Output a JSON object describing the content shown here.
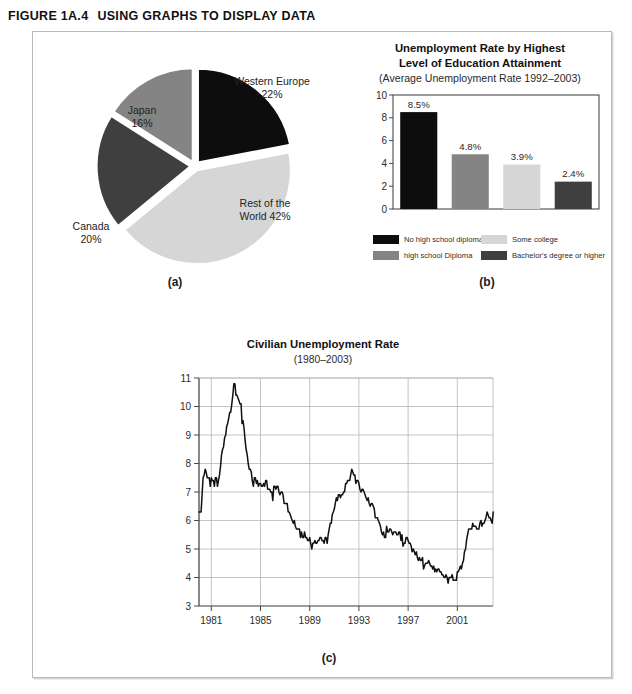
{
  "figure": {
    "number_label": "FIGURE 1A.4",
    "title": "USING GRAPHS TO DISPLAY DATA"
  },
  "panels": {
    "a_caption": "(a)",
    "b_caption": "(b)",
    "c_caption": "(c)"
  },
  "colors": {
    "black": "#0d0d0d",
    "dark_gray": "#3f3f3f",
    "medium_gray": "#848484",
    "light_gray": "#d6d6d6",
    "frame": "#b9b9bb",
    "grid": "#b5b5b5",
    "axis": "#4a4a4a"
  },
  "pie": {
    "labels": {
      "western_europe": "Western Europe\n22%",
      "japan": "Japan\n16%",
      "canada": "Canada\n20%",
      "rest_of_world": "Rest of the\nWorld 42%"
    }
  },
  "bar": {
    "title_line1": "Unemployment Rate by Highest",
    "title_line2": "Level of Education Attainment",
    "subtitle": "(Average Unemployment Rate 1992–2003)",
    "legend": [
      "No high school diploma",
      "Some college",
      "high school Diploma",
      "Bachelor's degree or higher"
    ]
  },
  "line": {
    "title": "Civilian Unemployment  Rate",
    "subtitle": "(1980–2003)"
  },
  "chart_data": [
    {
      "type": "pie",
      "title": "",
      "categories": [
        "Western Europe",
        "Rest of the World",
        "Canada",
        "Japan"
      ],
      "values": [
        22,
        42,
        20,
        16
      ],
      "labels": [
        "Western Europe 22%",
        "Rest of the World 42%",
        "Canada 20%",
        "Japan 16%"
      ],
      "colors": [
        "#0d0d0d",
        "#d6d6d6",
        "#3f3f3f",
        "#848484"
      ],
      "exploded": true,
      "legend": "none"
    },
    {
      "type": "bar",
      "title": "Unemployment Rate by Highest Level of Education Attainment",
      "subtitle": "(Average Unemployment Rate 1992–2003)",
      "categories": [
        "No high school diploma",
        "high school Diploma",
        "Some college",
        "Bachelor's degree or higher"
      ],
      "values": [
        8.5,
        4.8,
        3.9,
        2.4
      ],
      "data_labels": [
        "8.5%",
        "4.8%",
        "3.9%",
        "2.4%"
      ],
      "colors": [
        "#0d0d0d",
        "#848484",
        "#d6d6d6",
        "#3f3f3f"
      ],
      "xlabel": "",
      "ylabel": "",
      "ylim": [
        0,
        10
      ],
      "yticks": [
        0,
        2,
        4,
        6,
        8,
        10
      ],
      "ytick_labels": [
        "0",
        "2",
        "4",
        "6",
        "8",
        "10"
      ],
      "grid": false,
      "legend": "bottom"
    },
    {
      "type": "line",
      "title": "Civilian Unemployment  Rate",
      "subtitle": "(1980–2003)",
      "xlabel": "",
      "ylabel": "",
      "xlim": [
        1980.0,
        2003.9
      ],
      "ylim": [
        3,
        11
      ],
      "yticks": [
        3,
        4,
        5,
        6,
        7,
        8,
        9,
        10,
        11
      ],
      "ytick_labels": [
        "3",
        "4",
        "5",
        "6",
        "7",
        "8",
        "9",
        "10",
        "11"
      ],
      "xticks": [
        1981,
        1985,
        1989,
        1993,
        1997,
        2001
      ],
      "xtick_labels": [
        "1981",
        "1985",
        "1989",
        "1993",
        "1997",
        "2001"
      ],
      "grid": true,
      "legend": "none",
      "series": [
        {
          "name": "Civilian Unemployment Rate",
          "color": "#111111",
          "x": [
            1980.0,
            1980.08,
            1980.17,
            1980.25,
            1980.33,
            1980.42,
            1980.5,
            1980.58,
            1980.67,
            1980.75,
            1980.83,
            1980.92,
            1981.0,
            1981.08,
            1981.17,
            1981.25,
            1981.33,
            1981.42,
            1981.5,
            1981.58,
            1981.67,
            1981.75,
            1981.83,
            1981.92,
            1982.0,
            1982.08,
            1982.17,
            1982.25,
            1982.33,
            1982.42,
            1982.5,
            1982.58,
            1982.67,
            1982.75,
            1982.83,
            1982.92,
            1983.0,
            1983.08,
            1983.17,
            1983.25,
            1983.33,
            1983.42,
            1983.5,
            1983.58,
            1983.67,
            1983.75,
            1983.83,
            1983.92,
            1984.0,
            1984.08,
            1984.17,
            1984.25,
            1984.33,
            1984.42,
            1984.5,
            1984.58,
            1984.67,
            1984.75,
            1984.83,
            1984.92,
            1985.0,
            1985.08,
            1985.17,
            1985.25,
            1985.33,
            1985.42,
            1985.5,
            1985.58,
            1985.67,
            1985.75,
            1985.83,
            1985.92,
            1986.0,
            1986.08,
            1986.17,
            1986.25,
            1986.33,
            1986.42,
            1986.5,
            1986.58,
            1986.67,
            1986.75,
            1986.83,
            1986.92,
            1987.0,
            1987.08,
            1987.17,
            1987.25,
            1987.33,
            1987.42,
            1987.5,
            1987.58,
            1987.67,
            1987.75,
            1987.83,
            1987.92,
            1988.0,
            1988.08,
            1988.17,
            1988.25,
            1988.33,
            1988.42,
            1988.5,
            1988.58,
            1988.67,
            1988.75,
            1988.83,
            1988.92,
            1989.0,
            1989.08,
            1989.17,
            1989.25,
            1989.33,
            1989.42,
            1989.5,
            1989.58,
            1989.67,
            1989.75,
            1989.83,
            1989.92,
            1990.0,
            1990.08,
            1990.17,
            1990.25,
            1990.33,
            1990.42,
            1990.5,
            1990.58,
            1990.67,
            1990.75,
            1990.83,
            1990.92,
            1991.0,
            1991.08,
            1991.17,
            1991.25,
            1991.33,
            1991.42,
            1991.5,
            1991.58,
            1991.67,
            1991.75,
            1991.83,
            1991.92,
            1992.0,
            1992.08,
            1992.17,
            1992.25,
            1992.33,
            1992.42,
            1992.5,
            1992.58,
            1992.67,
            1992.75,
            1992.83,
            1992.92,
            1993.0,
            1993.08,
            1993.17,
            1993.25,
            1993.33,
            1993.42,
            1993.5,
            1993.58,
            1993.67,
            1993.75,
            1993.83,
            1993.92,
            1994.0,
            1994.08,
            1994.17,
            1994.25,
            1994.33,
            1994.42,
            1994.5,
            1994.58,
            1994.67,
            1994.75,
            1994.83,
            1994.92,
            1995.0,
            1995.08,
            1995.17,
            1995.25,
            1995.33,
            1995.42,
            1995.5,
            1995.58,
            1995.67,
            1995.75,
            1995.83,
            1995.92,
            1996.0,
            1996.08,
            1996.17,
            1996.25,
            1996.33,
            1996.42,
            1996.5,
            1996.58,
            1996.67,
            1996.75,
            1996.83,
            1996.92,
            1997.0,
            1997.08,
            1997.17,
            1997.25,
            1997.33,
            1997.42,
            1997.5,
            1997.58,
            1997.67,
            1997.75,
            1997.83,
            1997.92,
            1998.0,
            1998.08,
            1998.17,
            1998.25,
            1998.33,
            1998.42,
            1998.5,
            1998.58,
            1998.67,
            1998.75,
            1998.83,
            1998.92,
            1999.0,
            1999.08,
            1999.17,
            1999.25,
            1999.33,
            1999.42,
            1999.5,
            1999.58,
            1999.67,
            1999.75,
            1999.83,
            1999.92,
            2000.0,
            2000.08,
            2000.17,
            2000.25,
            2000.33,
            2000.42,
            2000.5,
            2000.58,
            2000.67,
            2000.75,
            2000.83,
            2000.92,
            2001.0,
            2001.08,
            2001.17,
            2001.25,
            2001.33,
            2001.42,
            2001.5,
            2001.58,
            2001.67,
            2001.75,
            2001.83,
            2001.92,
            2002.0,
            2002.08,
            2002.17,
            2002.25,
            2002.33,
            2002.42,
            2002.5,
            2002.58,
            2002.67,
            2002.75,
            2002.83,
            2002.92,
            2003.0,
            2003.08,
            2003.17,
            2003.25,
            2003.33,
            2003.42,
            2003.5,
            2003.58,
            2003.67,
            2003.75,
            2003.83,
            2003.92
          ],
          "y": [
            6.3,
            6.3,
            6.3,
            6.9,
            7.5,
            7.6,
            7.8,
            7.7,
            7.5,
            7.5,
            7.5,
            7.2,
            7.5,
            7.4,
            7.4,
            7.2,
            7.5,
            7.5,
            7.2,
            7.4,
            7.6,
            7.9,
            8.3,
            8.5,
            8.6,
            8.9,
            9.0,
            9.3,
            9.4,
            9.6,
            9.8,
            9.8,
            10.1,
            10.4,
            10.8,
            10.8,
            10.4,
            10.4,
            10.3,
            10.2,
            10.1,
            10.1,
            9.4,
            9.5,
            9.2,
            8.8,
            8.5,
            8.3,
            8.0,
            7.8,
            7.8,
            7.7,
            7.4,
            7.2,
            7.5,
            7.5,
            7.3,
            7.4,
            7.2,
            7.3,
            7.3,
            7.2,
            7.2,
            7.3,
            7.2,
            7.4,
            7.4,
            7.1,
            7.1,
            7.1,
            7.0,
            7.0,
            6.7,
            7.2,
            7.2,
            7.1,
            7.2,
            7.2,
            7.0,
            6.9,
            7.0,
            7.0,
            6.9,
            6.6,
            6.6,
            6.6,
            6.6,
            6.3,
            6.3,
            6.2,
            6.1,
            6.0,
            5.9,
            6.0,
            5.8,
            5.7,
            5.7,
            5.7,
            5.7,
            5.4,
            5.6,
            5.4,
            5.4,
            5.6,
            5.4,
            5.4,
            5.3,
            5.3,
            5.4,
            5.2,
            5.0,
            5.2,
            5.2,
            5.3,
            5.2,
            5.2,
            5.3,
            5.3,
            5.4,
            5.4,
            5.3,
            5.3,
            5.2,
            5.4,
            5.4,
            5.2,
            5.5,
            5.7,
            5.9,
            5.9,
            6.2,
            6.3,
            6.4,
            6.6,
            6.8,
            6.7,
            6.9,
            6.9,
            6.8,
            6.9,
            6.9,
            7.0,
            7.0,
            7.3,
            7.3,
            7.4,
            7.4,
            7.4,
            7.6,
            7.8,
            7.7,
            7.6,
            7.6,
            7.3,
            7.4,
            7.4,
            7.3,
            7.1,
            7.0,
            7.1,
            7.1,
            7.0,
            6.9,
            6.8,
            6.7,
            6.8,
            6.6,
            6.5,
            6.6,
            6.6,
            6.5,
            6.4,
            6.1,
            6.1,
            6.1,
            6.0,
            5.9,
            5.8,
            5.6,
            5.5,
            5.6,
            5.4,
            5.4,
            5.8,
            5.6,
            5.6,
            5.7,
            5.7,
            5.6,
            5.5,
            5.6,
            5.6,
            5.6,
            5.5,
            5.5,
            5.6,
            5.6,
            5.3,
            5.5,
            5.1,
            5.2,
            5.2,
            5.4,
            5.4,
            5.3,
            5.2,
            5.2,
            5.1,
            4.9,
            5.0,
            4.9,
            4.8,
            4.9,
            4.7,
            4.6,
            4.7,
            4.6,
            4.6,
            4.7,
            4.3,
            4.4,
            4.5,
            4.5,
            4.5,
            4.6,
            4.5,
            4.4,
            4.4,
            4.3,
            4.4,
            4.2,
            4.3,
            4.2,
            4.3,
            4.3,
            4.2,
            4.2,
            4.1,
            4.1,
            4.0,
            4.0,
            4.1,
            4.0,
            3.8,
            4.0,
            4.0,
            4.0,
            4.1,
            3.9,
            3.9,
            3.9,
            3.9,
            4.2,
            4.2,
            4.3,
            4.4,
            4.3,
            4.5,
            4.6,
            4.9,
            5.0,
            5.3,
            5.5,
            5.7,
            5.7,
            5.7,
            5.7,
            5.9,
            5.8,
            5.8,
            5.8,
            5.7,
            5.7,
            5.7,
            5.9,
            6.0,
            5.8,
            5.9,
            5.9,
            6.0,
            6.1,
            6.3,
            6.2,
            6.1,
            6.1,
            6.0,
            5.9,
            6.3
          ]
        }
      ]
    }
  ]
}
